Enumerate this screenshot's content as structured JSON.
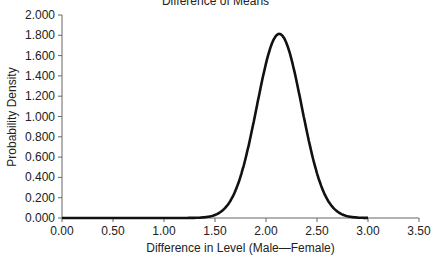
{
  "chart_data": {
    "type": "line",
    "title": "Difference of Means",
    "xlabel": "Difference in Level (Male—Female)",
    "ylabel": "Probability Density",
    "xlim": [
      0.0,
      3.5
    ],
    "ylim": [
      0.0,
      2.0
    ],
    "x_ticks": [
      "0.00",
      "0.50",
      "1.00",
      "1.50",
      "2.00",
      "2.50",
      "3.00",
      "3.50"
    ],
    "y_ticks": [
      "0.000",
      "0.200",
      "0.400",
      "0.600",
      "0.800",
      "1.000",
      "1.200",
      "1.400",
      "1.600",
      "1.800",
      "2.000"
    ],
    "grid": false,
    "legend": null,
    "series": [
      {
        "name": "Difference of Means density",
        "color": "#111111",
        "x": [
          0.0,
          0.5,
          1.0,
          1.3,
          1.4,
          1.5,
          1.6,
          1.7,
          1.8,
          1.9,
          2.0,
          2.05,
          2.1,
          2.13,
          2.15,
          2.2,
          2.3,
          2.4,
          2.5,
          2.6,
          2.7,
          2.8,
          2.9,
          3.0
        ],
        "y": [
          0.0,
          0.0,
          0.0,
          0.002,
          0.007,
          0.031,
          0.1,
          0.271,
          0.554,
          0.91,
          1.277,
          1.465,
          1.64,
          1.813,
          1.79,
          1.7,
          1.414,
          0.93,
          0.44,
          0.178,
          0.061,
          0.018,
          0.004,
          0.001
        ]
      }
    ]
  }
}
